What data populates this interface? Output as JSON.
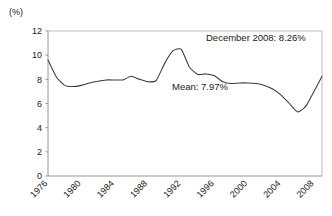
{
  "chart_data": {
    "type": "line",
    "title": "",
    "subtitle": "",
    "unit_label": "(%)",
    "xlabel": "",
    "ylabel": "",
    "ylim": [
      0,
      12
    ],
    "xlim": [
      1976,
      2008.92
    ],
    "grid": false,
    "legend": "none",
    "y_ticks": [
      0,
      2,
      4,
      6,
      8,
      10,
      12
    ],
    "y_tick_labels": [
      "0",
      "2",
      "4",
      "6",
      "8",
      "10",
      "12"
    ],
    "x_ticks": [
      1976,
      1980,
      1984,
      1988,
      1992,
      1996,
      2000,
      2004,
      2008
    ],
    "x_tick_labels": [
      "1976",
      "1980",
      "1984",
      "1988",
      "1992",
      "1996",
      "2000",
      "2004",
      "2008"
    ],
    "x_tick_rotation_deg": 45,
    "line_color": "#3a3a3a",
    "axis_color": "#8c8c8c",
    "series": [
      {
        "name": "Rate",
        "x": [
          1976,
          1977,
          1978,
          1979,
          1980,
          1981,
          1982,
          1983,
          1984,
          1985,
          1986,
          1987,
          1988,
          1989,
          1990,
          1991,
          1992,
          1993,
          1994,
          1995,
          1996,
          1997,
          1998,
          1999,
          2000,
          2001,
          2002,
          2003,
          2004,
          2005,
          2006,
          2007,
          2008.92
        ],
        "values": [
          9.6,
          8.2,
          7.5,
          7.4,
          7.5,
          7.7,
          7.85,
          7.95,
          7.95,
          7.95,
          8.25,
          8.0,
          7.8,
          7.9,
          9.3,
          10.35,
          10.5,
          9.0,
          8.4,
          8.45,
          8.3,
          7.8,
          7.65,
          7.7,
          7.7,
          7.65,
          7.5,
          7.2,
          6.7,
          6.0,
          5.3,
          5.8,
          8.26
        ]
      }
    ],
    "annotations": [
      {
        "id": "december-2008-annotation",
        "text": "December 2008: 8.26%",
        "x_px": 206,
        "y_px": 41
      },
      {
        "id": "mean-annotation",
        "text": "Mean: 7.97%",
        "x_px": 172,
        "y_px": 90
      }
    ],
    "december_2008_value": 8.26,
    "mean_value": 7.97
  }
}
